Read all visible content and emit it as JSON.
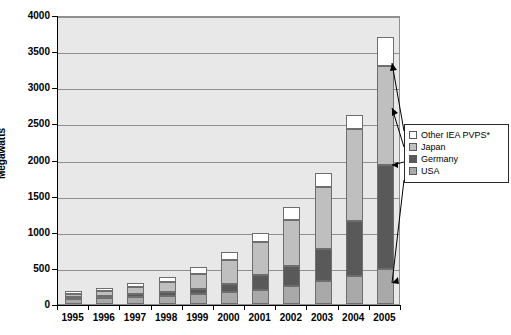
{
  "chart_data": {
    "type": "bar",
    "subtype": "stacked-column",
    "title": "",
    "xlabel": "",
    "ylabel": "Megawatts",
    "ylim": [
      0,
      4000
    ],
    "ytick_step": 500,
    "yticks": [
      "0",
      "500",
      "1000",
      "1500",
      "2000",
      "2500",
      "3000",
      "3500",
      "4000"
    ],
    "grid": true,
    "legend_position": "right",
    "categories": [
      "1995",
      "1996",
      "1997",
      "1998",
      "1999",
      "2000",
      "2001",
      "2002",
      "2003",
      "2004",
      "2005"
    ],
    "series": [
      {
        "name": "USA",
        "color": "#a9a9a9",
        "values": [
          75,
          85,
          100,
          115,
          135,
          165,
          200,
          250,
          320,
          390,
          480
        ]
      },
      {
        "name": "Germany",
        "color": "#595959",
        "values": [
          20,
          25,
          35,
          55,
          75,
          115,
          200,
          280,
          440,
          760,
          1450
        ]
      },
      {
        "name": "Japan",
        "color": "#bfbfbf",
        "values": [
          45,
          65,
          100,
          135,
          210,
          330,
          460,
          630,
          860,
          1270,
          1370
        ]
      },
      {
        "name": "Other IEA PVPS*",
        "color": "#ffffff",
        "values": [
          40,
          50,
          55,
          75,
          90,
          110,
          120,
          180,
          200,
          190,
          400
        ]
      }
    ],
    "totals": [
      180,
      225,
      290,
      380,
      510,
      720,
      980,
      1340,
      1820,
      2610,
      3700
    ]
  },
  "legend": {
    "items": [
      {
        "label": "Other IEA PVPS*",
        "color": "#ffffff"
      },
      {
        "label": "Japan",
        "color": "#bfbfbf"
      },
      {
        "label": "Germany",
        "color": "#595959"
      },
      {
        "label": "USA",
        "color": "#a9a9a9"
      }
    ]
  },
  "axis": {
    "y_title": "Megawatts"
  },
  "colors": {
    "plot_background": "#e8e8e8",
    "gridline": "#8f8f8f",
    "axis": "#000000",
    "segment_border": "#6e6e6e"
  }
}
